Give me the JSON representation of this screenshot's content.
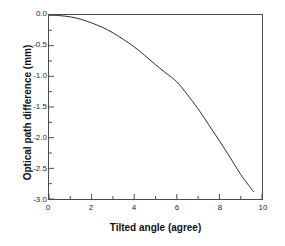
{
  "chart_data": {
    "type": "line",
    "title": "",
    "xlabel": "Tilted angle (agree)",
    "ylabel": "Optical path difference (mm)",
    "xlim": [
      0,
      10
    ],
    "ylim": [
      -3.0,
      0.0
    ],
    "grid": false,
    "legend": null,
    "xticks": [
      {
        "value": 0,
        "label": "0"
      },
      {
        "value": 2,
        "label": "2"
      },
      {
        "value": 4,
        "label": "4"
      },
      {
        "value": 6,
        "label": "6"
      },
      {
        "value": 8,
        "label": "8"
      },
      {
        "value": 10,
        "label": "10"
      }
    ],
    "x_minor_ticks": [
      1,
      3,
      5,
      7,
      9
    ],
    "yticks": [
      {
        "value": 0.0,
        "label": "0.0"
      },
      {
        "value": -0.5,
        "label": "-0.5"
      },
      {
        "value": -1.0,
        "label": "-1.0"
      },
      {
        "value": -1.5,
        "label": "-1.5"
      },
      {
        "value": -2.0,
        "label": "-2.0"
      },
      {
        "value": -2.5,
        "label": "-2.5"
      },
      {
        "value": -3.0,
        "label": "-3.0"
      }
    ],
    "y_minor_ticks": [
      -0.25,
      -0.75,
      -1.25,
      -1.75,
      -2.25,
      -2.75
    ],
    "series": [
      {
        "name": "optical path difference",
        "color": "#2b2b2b",
        "linewidth": 1,
        "x": [
          0.0,
          0.5,
          1.0,
          1.5,
          2.0,
          2.5,
          3.0,
          3.5,
          4.0,
          4.5,
          5.0,
          5.5,
          6.0,
          6.5,
          7.0,
          7.5,
          8.0,
          8.5,
          9.0,
          9.6
        ],
        "y": [
          0.0,
          -0.01,
          -0.03,
          -0.07,
          -0.13,
          -0.2,
          -0.29,
          -0.4,
          -0.52,
          -0.66,
          -0.81,
          -0.95,
          -1.09,
          -1.3,
          -1.53,
          -1.79,
          -2.05,
          -2.32,
          -2.6,
          -2.88
        ]
      }
    ]
  },
  "axes": {
    "frame_color": "#4a4a4a"
  }
}
